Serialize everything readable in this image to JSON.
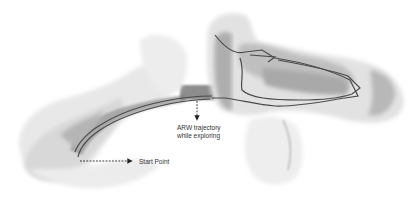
{
  "figure": {
    "annotations": {
      "trajectory_label_line1": "ARW trajectory",
      "trajectory_label_line2": "while exploring",
      "start_label": "Start Point"
    },
    "colors": {
      "background": "#ffffff",
      "point_cloud_light": "#e6e6e6",
      "point_cloud_mid": "#bdbdbd",
      "point_cloud_dark": "#6e6e6e",
      "trajectory": "#4a4a4a",
      "annotation_text": "#333333",
      "arrow": "#222222"
    }
  }
}
